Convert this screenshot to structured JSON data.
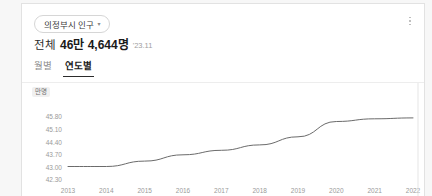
{
  "card": {
    "region_selector": {
      "label": "의정부시 인구",
      "caret": "chevron-down-icon"
    },
    "menu_icon": "kebab-menu-icon",
    "summary": {
      "label": "전체",
      "value": "46만 4,644명",
      "date": "'23.11"
    },
    "tabs": [
      {
        "label": "월별",
        "active": false
      },
      {
        "label": "연도별",
        "active": true
      }
    ]
  },
  "chart_data": {
    "type": "line",
    "title": "",
    "xlabel": "",
    "ylabel": "만명",
    "unit_label": "만명",
    "categories": [
      "2013",
      "2014",
      "2015",
      "2016",
      "2017",
      "2018",
      "2019",
      "2020",
      "2021",
      "2022"
    ],
    "values": [
      43.05,
      43.05,
      43.35,
      43.7,
      43.95,
      44.25,
      44.7,
      45.55,
      45.7,
      45.75
    ],
    "yticks": [
      "45.80",
      "45.10",
      "44.40",
      "43.70",
      "43.00",
      "42.30"
    ],
    "ytick_values": [
      45.8,
      45.1,
      44.4,
      43.7,
      43.0,
      42.3
    ],
    "ylim": [
      42.3,
      45.8
    ],
    "grid": false,
    "legend": false,
    "series_color": "#6b6b6b"
  }
}
